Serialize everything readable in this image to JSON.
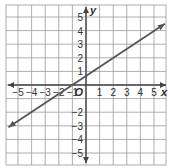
{
  "graph": {
    "x_axis_label": "x",
    "y_axis_label": "y",
    "origin_label": "O",
    "x_ticks": [
      "−5",
      "−4",
      "−3",
      "−2",
      "−1",
      "1",
      "2",
      "3",
      "4",
      "5"
    ],
    "y_ticks": [
      "5",
      "4",
      "3",
      "2",
      "1",
      "−2",
      "−3",
      "−4",
      "−5"
    ],
    "x_range": [
      -6,
      6
    ],
    "y_range": [
      -6,
      6
    ],
    "line": {
      "equation": "y = (2/3)x + 2/3",
      "slope": 0.6667,
      "y_intercept": 0.6667,
      "x_intercept": -1,
      "start": [
        -5.7,
        -3.1
      ],
      "end": [
        5.8,
        4.5
      ],
      "color": "#555555"
    },
    "grid_color": "#9a9a9a",
    "axis_color": "#444444"
  }
}
